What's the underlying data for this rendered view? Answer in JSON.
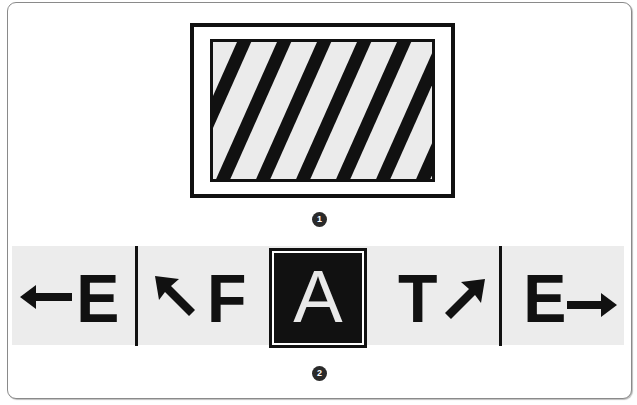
{
  "figure1": {
    "label": "hatched-sign",
    "badge": "1",
    "colors": {
      "stripe": "#111111",
      "background": "#ebebeb",
      "border": "#111111"
    }
  },
  "figure2": {
    "badge": "2",
    "segments": [
      {
        "arrow": "arrow-left-icon",
        "letter": "E"
      },
      {
        "arrow": "arrow-up-left-icon",
        "letter": "F"
      },
      {
        "letter": "A",
        "highlighted": true
      },
      {
        "letter": "T",
        "arrow": "arrow-up-right-icon"
      },
      {
        "letter": "E",
        "arrow": "arrow-right-icon"
      }
    ],
    "colors": {
      "band": "#ececec",
      "ink": "#111111",
      "highlight_letter": "#e9e9e9"
    }
  }
}
